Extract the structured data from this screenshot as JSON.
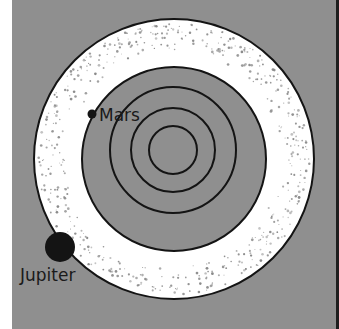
{
  "diagram": {
    "colors": {
      "margin": "#ffffff",
      "background": "#8f8f8f",
      "belt": "#ffffff",
      "lines": "#141414",
      "speckle": "#8a8a8a",
      "right_border": "#1e1e1e"
    },
    "inner_center": {
      "x": 173,
      "y": 150
    },
    "belt_center": {
      "x": 174,
      "y": 159
    },
    "belt": {
      "outer_radius": 140,
      "inner_radius": 92
    },
    "orbits": [
      {
        "name": "innermost-orbit",
        "r": 24
      },
      {
        "name": "second-orbit",
        "r": 42
      },
      {
        "name": "mars-orbit",
        "r": 63
      }
    ],
    "planets": [
      {
        "name": "Mars",
        "x": 92,
        "y": 114,
        "r": 4.5,
        "label_x": 99,
        "label_y": 121
      },
      {
        "name": "Jupiter",
        "x": 60,
        "y": 247,
        "r": 15,
        "label_x": 20,
        "label_y": 281
      }
    ],
    "labels": {
      "mars": "Mars",
      "jupiter": "Jupiter"
    },
    "speckle_count": 520,
    "speckle_seed": 7
  }
}
